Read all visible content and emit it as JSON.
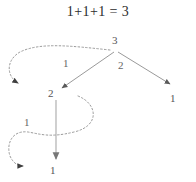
{
  "figure": {
    "title": "1+1+1 = 3",
    "type": "tree-diagram",
    "colors": {
      "title_text": "#2b2b2b",
      "node_text": "#555555",
      "edge_label_text": "#666666",
      "solid_edge": "#999999",
      "dashed_curve": "#9a9a9a",
      "arrowhead": "#4a4a4a",
      "background": "#ffffff"
    },
    "nodes": [
      {
        "id": "root",
        "label": "3",
        "x": 116,
        "y": 41
      },
      {
        "id": "left-child",
        "label": "2",
        "x": 52,
        "y": 94
      },
      {
        "id": "right-leaf",
        "label": "1",
        "x": 174,
        "y": 99
      },
      {
        "id": "bottom-leaf",
        "label": "1",
        "x": 54,
        "y": 171
      }
    ],
    "edges": [
      {
        "id": "root-to-left",
        "label": "1",
        "label_x": 66,
        "label_y": 64,
        "from": "root",
        "to": "left-child"
      },
      {
        "id": "root-to-right",
        "label": "2",
        "label_x": 121,
        "label_y": 66,
        "from": "root",
        "to": "right-leaf"
      },
      {
        "id": "left-to-bottom",
        "label": "1",
        "label_x": 27,
        "label_y": 123,
        "from": "left-child",
        "to": "bottom-leaf"
      }
    ],
    "dashed_curves": [
      {
        "id": "upper-loop-curve",
        "arrow_direction": "down-right",
        "arrow_x": 24,
        "arrow_y": 86
      },
      {
        "id": "lower-s-curve",
        "arrow_direction": "right",
        "arrow_x": 29,
        "arrow_y": 166
      }
    ]
  }
}
